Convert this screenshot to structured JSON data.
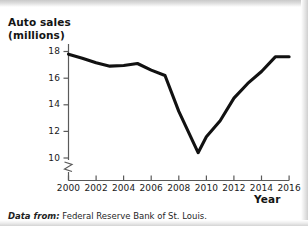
{
  "figure": {
    "width": 308,
    "height": 226,
    "background": "#ffffff",
    "line_color": "#111111",
    "axis_color": "#5a5a5a"
  },
  "source_note": {
    "lead": "Data from:",
    "body": "Federal Reserve Bank of St. Louis."
  },
  "chart_data": {
    "type": "line",
    "title": "",
    "ylabel": "Auto sales\n(millions)",
    "xlabel": "Year",
    "xlim": [
      2000,
      2016
    ],
    "ylim": [
      9.2,
      18.6
    ],
    "grid": false,
    "legend": null,
    "y_axis_break": true,
    "xticks": [
      2000,
      2002,
      2004,
      2006,
      2008,
      2010,
      2012,
      2014,
      2016
    ],
    "xticklabels": [
      "2000",
      "2002",
      "2004",
      "2006",
      "2008",
      "2010",
      "2012",
      "2014",
      "2016"
    ],
    "yticks": [
      10,
      12,
      14,
      16,
      18
    ],
    "yticklabels": [
      "10",
      "12",
      "14",
      "16",
      "18"
    ],
    "series": [
      {
        "name": "Auto sales (millions)",
        "color": "#111111",
        "x": [
          2000,
          2001,
          2002,
          2003,
          2004,
          2005,
          2006,
          2007,
          2008,
          2009.4,
          2010,
          2011,
          2012,
          2013,
          2014,
          2015,
          2016
        ],
        "values": [
          17.8,
          17.5,
          17.15,
          16.9,
          16.95,
          17.1,
          16.6,
          16.2,
          13.5,
          10.4,
          11.6,
          12.8,
          14.5,
          15.6,
          16.5,
          17.6,
          17.6
        ]
      }
    ]
  }
}
